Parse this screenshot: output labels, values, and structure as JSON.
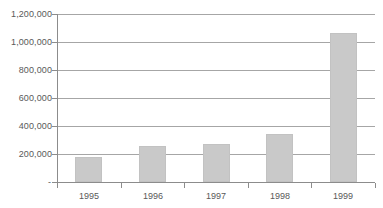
{
  "chart_data": {
    "type": "bar",
    "title": "",
    "subtitle": "",
    "xlabel": "",
    "ylabel": "",
    "categories": [
      "1995",
      "1996",
      "1997",
      "1998",
      "1999"
    ],
    "values": [
      180000,
      258000,
      272000,
      342000,
      1065000
    ],
    "series": [
      {
        "name": "",
        "values": [
          180000,
          258000,
          272000,
          342000,
          1065000
        ]
      }
    ],
    "ylim": [
      0,
      1200000
    ],
    "ytick_values": [
      0,
      200000,
      400000,
      600000,
      800000,
      1000000,
      1200000
    ],
    "ytick_labels": [
      "-",
      "200,000",
      "400,000",
      "600,000",
      "800,000",
      "1,000,000",
      "1,200,000"
    ],
    "xtick_labels": [
      "1995",
      "1996",
      "1997",
      "1998",
      "1999"
    ],
    "grid": true,
    "grid_axis": "y",
    "legend": false,
    "legend_position": "none",
    "annotations": [],
    "colors": {
      "bar_fill": "#c9c9c9",
      "bar_border": "#c2c2c2",
      "gridline": "#a6a6a6",
      "axis": "#8c8c8c",
      "text": "#595959",
      "background": "#ffffff"
    }
  }
}
